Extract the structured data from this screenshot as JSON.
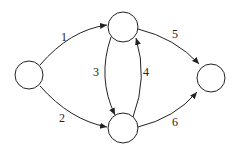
{
  "diagram": {
    "type": "directed-graph",
    "nodes": [
      {
        "id": "s",
        "cx": 29,
        "cy": 75
      },
      {
        "id": "a",
        "cx": 123,
        "cy": 27
      },
      {
        "id": "b",
        "cx": 123,
        "cy": 128
      },
      {
        "id": "t",
        "cx": 211,
        "cy": 78
      }
    ],
    "edges": [
      {
        "from": "s",
        "to": "a",
        "label": "1"
      },
      {
        "from": "s",
        "to": "b",
        "label": "2"
      },
      {
        "from": "a",
        "to": "b",
        "label": "3"
      },
      {
        "from": "b",
        "to": "a",
        "label": "4"
      },
      {
        "from": "a",
        "to": "t",
        "label": "5"
      },
      {
        "from": "b",
        "to": "t",
        "label": "6"
      }
    ],
    "colors": {
      "stroke": "#222222",
      "fill": "#ffffff"
    }
  }
}
